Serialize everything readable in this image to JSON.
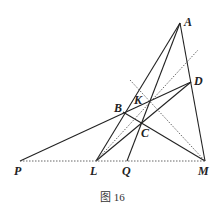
{
  "figure": {
    "caption": "图 16",
    "points": {
      "A": {
        "label": "A",
        "x": 180,
        "y": 23
      },
      "D": {
        "label": "D",
        "x": 191,
        "y": 82
      },
      "K": {
        "label": "K",
        "x": 149,
        "y": 103
      },
      "B": {
        "label": "B",
        "x": 123,
        "y": 112
      },
      "C": {
        "label": "C",
        "x": 141,
        "y": 124
      },
      "P": {
        "label": "P",
        "x": 20,
        "y": 161
      },
      "L": {
        "label": "L",
        "x": 96,
        "y": 161
      },
      "Q": {
        "label": "Q",
        "x": 127,
        "y": 161
      },
      "M": {
        "label": "M",
        "x": 205,
        "y": 161
      }
    },
    "solid_segments": [
      [
        "A",
        "L"
      ],
      [
        "A",
        "Q"
      ],
      [
        "A",
        "M"
      ],
      [
        "P",
        "D"
      ],
      [
        "B",
        "M"
      ],
      [
        "L",
        "D"
      ]
    ],
    "dotted_segments": [
      [
        "P",
        "M"
      ],
      [
        "L",
        "K-ext"
      ],
      [
        "ext",
        "M"
      ]
    ]
  }
}
